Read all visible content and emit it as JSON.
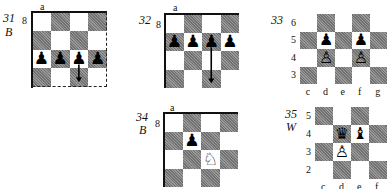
{
  "diagrams": [
    {
      "id": "31",
      "number_label": "31",
      "side_label": "B",
      "corner_file_label": "a",
      "corner_rank_label": "8",
      "cols": 4,
      "rows": 4,
      "first_square_dark": false,
      "pieces": [
        {
          "row": 2,
          "col": 0,
          "glyph": "♟",
          "color": "black",
          "name": "black-pawn"
        },
        {
          "row": 2,
          "col": 1,
          "glyph": "♟",
          "color": "black",
          "name": "black-pawn"
        },
        {
          "row": 2,
          "col": 2,
          "glyph": "♟",
          "color": "black",
          "name": "black-pawn"
        },
        {
          "row": 2,
          "col": 3,
          "glyph": "♟",
          "color": "black",
          "name": "black-pawn"
        }
      ],
      "arrows": [
        {
          "from": {
            "row": 2,
            "col": 2
          },
          "to": {
            "row": 3,
            "col": 2
          }
        }
      ]
    },
    {
      "id": "32",
      "number_label": "32",
      "side_label": "",
      "corner_file_label": "a",
      "corner_rank_label": "8",
      "cols": 4,
      "rows": 4,
      "first_square_dark": false,
      "pieces": [
        {
          "row": 1,
          "col": 0,
          "glyph": "♟",
          "color": "black",
          "name": "black-pawn"
        },
        {
          "row": 1,
          "col": 1,
          "glyph": "♟",
          "color": "black",
          "name": "black-pawn"
        },
        {
          "row": 1,
          "col": 2,
          "glyph": "♟",
          "color": "black",
          "name": "black-pawn"
        },
        {
          "row": 1,
          "col": 3,
          "glyph": "♟",
          "color": "black",
          "name": "black-pawn"
        }
      ],
      "arrows": [
        {
          "from": {
            "row": 1,
            "col": 2
          },
          "to": {
            "row": 3,
            "col": 2
          }
        }
      ]
    },
    {
      "id": "33",
      "number_label": "33",
      "side_label": "",
      "rank_labels": [
        "6",
        "5",
        "4",
        "3"
      ],
      "file_labels": [
        "c",
        "d",
        "e",
        "f",
        "g"
      ],
      "cols": 5,
      "rows": 4,
      "first_square_dark": false,
      "pieces": [
        {
          "row": 1,
          "col": 1,
          "glyph": "♟",
          "color": "black",
          "name": "black-pawn"
        },
        {
          "row": 1,
          "col": 3,
          "glyph": "♟",
          "color": "black",
          "name": "black-pawn"
        },
        {
          "row": 2,
          "col": 1,
          "glyph": "♙",
          "color": "white",
          "name": "white-pawn"
        },
        {
          "row": 2,
          "col": 3,
          "glyph": "♙",
          "color": "white",
          "name": "white-pawn"
        }
      ],
      "arrows": []
    },
    {
      "id": "34",
      "number_label": "34",
      "side_label": "B",
      "corner_file_label": "a",
      "corner_rank_label": "8",
      "cols": 4,
      "rows": 4,
      "first_square_dark": false,
      "pieces": [
        {
          "row": 1,
          "col": 1,
          "glyph": "♟",
          "color": "black",
          "name": "black-pawn"
        },
        {
          "row": 2,
          "col": 2,
          "glyph": "♘",
          "color": "white",
          "name": "white-knight"
        }
      ],
      "arrows": []
    },
    {
      "id": "35",
      "number_label": "35",
      "side_label": "W",
      "rank_labels": [
        "5",
        "4",
        "3",
        "2"
      ],
      "file_labels": [
        "c",
        "d",
        "e",
        "f"
      ],
      "cols": 4,
      "rows": 4,
      "first_square_dark": true,
      "pieces": [
        {
          "row": 1,
          "col": 1,
          "glyph": "♛",
          "color": "black",
          "name": "black-queen"
        },
        {
          "row": 1,
          "col": 2,
          "glyph": "♝",
          "color": "black",
          "name": "black-bishop"
        },
        {
          "row": 2,
          "col": 1,
          "glyph": "♙",
          "color": "white",
          "name": "white-pawn"
        }
      ],
      "arrows": []
    }
  ],
  "colors": {
    "dark_square": "#8a8a8a",
    "light_square": "#ffffff",
    "ink": "#111111"
  }
}
